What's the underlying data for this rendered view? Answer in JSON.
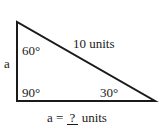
{
  "diagram": {
    "type": "right-triangle",
    "vertices": {
      "top": [
        17,
        22
      ],
      "bottom_left": [
        17,
        101
      ],
      "bottom_right": [
        155,
        101
      ]
    },
    "line_color": "#1a1a1a",
    "labels": {
      "side_a": "a",
      "hypotenuse": "10 units",
      "angle_top": "60°",
      "angle_right": "90°",
      "angle_bottom_right": "30°"
    },
    "caption": {
      "prefix": "a = ",
      "blank": "?",
      "suffix": " units"
    }
  }
}
